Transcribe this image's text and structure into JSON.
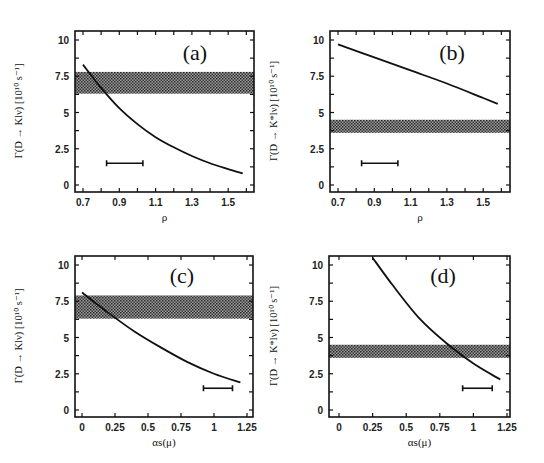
{
  "chart_data": [
    {
      "panel": "(a)",
      "type": "line",
      "xlabel": "ρ",
      "ylabel": "Γ(D → Klν) [10¹⁰ s⁻¹]",
      "xlim": [
        0.655,
        1.65
      ],
      "ylim": [
        -0.3,
        10.5
      ],
      "xticks": [
        0.7,
        0.9,
        1.1,
        1.3,
        1.5
      ],
      "xticklabels": [
        "0.7",
        "0.9",
        "1.1",
        "1.3",
        "1.5"
      ],
      "xminor": [
        0.8,
        1.0,
        1.2,
        1.4,
        1.6
      ],
      "yticks": [
        0,
        2.5,
        5,
        7.5,
        10
      ],
      "yticklabels": [
        "0",
        "2.5",
        "5",
        "7.5",
        "10"
      ],
      "grid": false,
      "band": {
        "ymin": 6.3,
        "ymax": 7.8,
        "label": "experimental range"
      },
      "curve": {
        "x": [
          0.7,
          0.8,
          0.9,
          1.0,
          1.1,
          1.2,
          1.3,
          1.4,
          1.5,
          1.58
        ],
        "y": [
          8.3,
          6.7,
          5.3,
          4.2,
          3.3,
          2.6,
          2.0,
          1.5,
          1.1,
          0.8
        ]
      },
      "errorbar": {
        "xmin": 0.83,
        "xmax": 1.03,
        "y": 1.5
      }
    },
    {
      "panel": "(b)",
      "type": "line",
      "xlabel": "ρ",
      "ylabel": "Γ(D → K*lν) [10¹⁰ s⁻¹]",
      "xlim": [
        0.655,
        1.65
      ],
      "ylim": [
        -0.3,
        10.5
      ],
      "xticks": [
        0.7,
        0.9,
        1.1,
        1.3,
        1.5
      ],
      "xticklabels": [
        "0.7",
        "0.9",
        "1.1",
        "1.3",
        "1.5"
      ],
      "xminor": [
        0.8,
        1.0,
        1.2,
        1.4,
        1.6
      ],
      "yticks": [
        0,
        2.5,
        5,
        7.5,
        10
      ],
      "yticklabels": [
        "0",
        "2.5",
        "5",
        "7.5",
        "10"
      ],
      "grid": false,
      "band": {
        "ymin": 3.6,
        "ymax": 4.5,
        "label": "experimental range"
      },
      "curve": {
        "x": [
          0.7,
          0.9,
          1.1,
          1.3,
          1.5,
          1.58
        ],
        "y": [
          9.7,
          8.8,
          7.9,
          7.0,
          6.0,
          5.6
        ]
      },
      "errorbar": {
        "xmin": 0.83,
        "xmax": 1.03,
        "y": 1.5
      }
    },
    {
      "panel": "(c)",
      "type": "line",
      "xlabel": "αs(μ)",
      "ylabel": "Γ(D → Klν) [10¹⁰ s⁻¹]",
      "xlim": [
        -0.05,
        1.3
      ],
      "ylim": [
        -0.3,
        10.5
      ],
      "xticks": [
        0,
        0.25,
        0.5,
        0.75,
        1,
        1.25
      ],
      "xticklabels": [
        "0",
        "0.25",
        "0.5",
        "0.75",
        "1",
        "1.25"
      ],
      "xminor": [],
      "yticks": [
        0,
        2.5,
        5,
        7.5,
        10
      ],
      "yticklabels": [
        "0",
        "2.5",
        "5",
        "7.5",
        "10"
      ],
      "grid": false,
      "band": {
        "ymin": 6.3,
        "ymax": 7.9,
        "label": "experimental range"
      },
      "curve": {
        "x": [
          0,
          0.2,
          0.4,
          0.6,
          0.8,
          1.0,
          1.2
        ],
        "y": [
          8.1,
          6.7,
          5.4,
          4.3,
          3.3,
          2.5,
          1.9
        ]
      },
      "errorbar": {
        "xmin": 0.92,
        "xmax": 1.14,
        "y": 1.5
      }
    },
    {
      "panel": "(d)",
      "type": "line",
      "xlabel": "αs(μ)",
      "ylabel": "Γ(D → K*lν) [10¹⁰ s⁻¹]",
      "xlim": [
        -0.05,
        1.3
      ],
      "ylim": [
        -0.3,
        10.5
      ],
      "xticks": [
        0,
        0.25,
        0.5,
        0.75,
        1,
        1.25
      ],
      "xticklabels": [
        "0",
        "0.25",
        "0.5",
        "0.75",
        "1",
        "1.25"
      ],
      "xminor": [],
      "yticks": [
        0,
        2.5,
        5,
        7.5,
        10
      ],
      "yticklabels": [
        "0",
        "2.5",
        "5",
        "7.5",
        "10"
      ],
      "grid": false,
      "band": {
        "ymin": 3.6,
        "ymax": 4.5,
        "label": "experimental range"
      },
      "curve": {
        "x": [
          0.25,
          0.4,
          0.6,
          0.8,
          1.0,
          1.2
        ],
        "y": [
          10.5,
          8.6,
          6.3,
          4.6,
          3.2,
          2.1
        ]
      },
      "errorbar": {
        "xmin": 0.92,
        "xmax": 1.14,
        "y": 1.5
      }
    }
  ],
  "layout": [
    {
      "frame": [
        75,
        31,
        254,
        192
      ],
      "x0": 0.7,
      "px0": 83,
      "pxPerUnit": 181.5,
      "y0px": 185,
      "pxPerY": 14.5,
      "tag": [
        195,
        60
      ],
      "ylab": [
        22,
        111
      ]
    },
    {
      "frame": [
        330,
        31,
        510,
        192
      ],
      "x0": 0.7,
      "px0": 338,
      "pxPerUnit": 181.5,
      "y0px": 185,
      "pxPerY": 14.5,
      "tag": [
        452,
        60
      ],
      "ylab": [
        277,
        111
      ]
    },
    {
      "frame": [
        75,
        256,
        253,
        417
      ],
      "x0": 0,
      "px0": 82,
      "pxPerUnit": 132,
      "y0px": 410,
      "pxPerY": 14.5,
      "tag": [
        182,
        283
      ],
      "ylab": [
        22,
        336
      ]
    },
    {
      "frame": [
        329,
        256,
        510,
        417
      ],
      "x0": 0,
      "px0": 339,
      "pxPerUnit": 134.4,
      "y0px": 410,
      "pxPerY": 14.5,
      "tag": [
        443,
        283
      ],
      "ylab": [
        277,
        336
      ]
    }
  ]
}
